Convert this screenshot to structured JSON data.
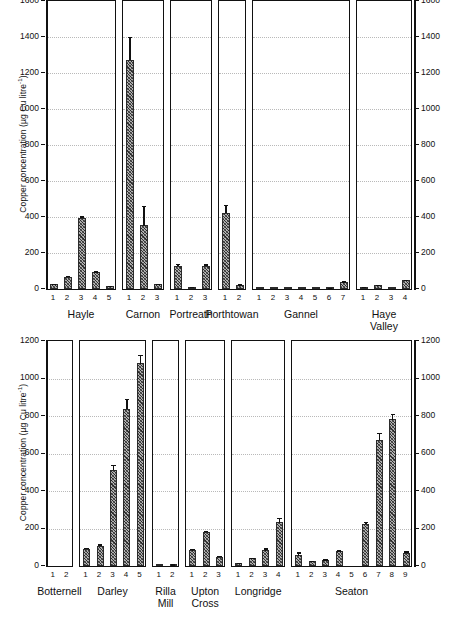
{
  "figure": {
    "axis_label": "Copper concentration (µg Cu litre",
    "axis_label_sup": "-1",
    "axis_label_tail": ")"
  },
  "chart_data": {
    "type": "bar",
    "title": "",
    "xlabel": "",
    "ylabel": "Copper concentration (µg Cu litre⁻¹)",
    "grid": true,
    "legend": "none",
    "error_bars": "standard error",
    "panels": [
      {
        "row": 0,
        "site": "Hayle",
        "ylim": [
          0,
          1600
        ],
        "yticks": [
          0,
          200,
          400,
          600,
          800,
          1000,
          1200,
          1400,
          1600
        ],
        "categories": [
          "1",
          "2",
          "3",
          "4",
          "5"
        ],
        "values": [
          25,
          65,
          395,
          92,
          12
        ],
        "errors": [
          4,
          10,
          8,
          6,
          3
        ]
      },
      {
        "row": 0,
        "site": "Carnon",
        "ylim": [
          0,
          1600
        ],
        "yticks": [
          0,
          200,
          400,
          600,
          800,
          1000,
          1200,
          1400,
          1600
        ],
        "categories": [
          "1",
          "2",
          "3"
        ],
        "values": [
          1270,
          352,
          25
        ],
        "errors": [
          130,
          110,
          5
        ]
      },
      {
        "row": 0,
        "site": "Portreath",
        "ylim": [
          0,
          1600
        ],
        "yticks": [
          0,
          200,
          400,
          600,
          800,
          1000,
          1200,
          1400,
          1600
        ],
        "categories": [
          "1",
          "2",
          "3"
        ],
        "values": [
          128,
          8,
          125
        ],
        "errors": [
          10,
          2,
          12
        ]
      },
      {
        "row": 0,
        "site": "Porthtowan",
        "ylim": [
          0,
          1600
        ],
        "yticks": [
          0,
          200,
          400,
          600,
          800,
          1000,
          1200,
          1400,
          1600
        ],
        "categories": [
          "1",
          "2"
        ],
        "values": [
          420,
          22
        ],
        "errors": [
          45,
          4
        ]
      },
      {
        "row": 0,
        "site": "Gannel",
        "ylim": [
          0,
          1600
        ],
        "yticks": [
          0,
          200,
          400,
          600,
          800,
          1000,
          1200,
          1400,
          1600
        ],
        "categories": [
          "1",
          "2",
          "3",
          "4",
          "5",
          "6",
          "7"
        ],
        "values": [
          2,
          2,
          2,
          2,
          2,
          5,
          38
        ],
        "errors": [
          0,
          0,
          0,
          0,
          0,
          1,
          4
        ]
      },
      {
        "row": 0,
        "site": "Haye\nValley",
        "ylim": [
          0,
          1600
        ],
        "yticks": [
          0,
          200,
          400,
          600,
          800,
          1000,
          1200,
          1400,
          1600
        ],
        "categories": [
          "1",
          "2",
          "3",
          "4"
        ],
        "values": [
          8,
          20,
          2,
          48
        ],
        "errors": [
          2,
          3,
          0,
          4
        ]
      },
      {
        "row": 1,
        "site": "Botternell",
        "ylim": [
          0,
          1200
        ],
        "yticks": [
          0,
          200,
          400,
          600,
          800,
          1000,
          1200
        ],
        "categories": [
          "1",
          "2"
        ],
        "values": [
          0,
          0
        ],
        "errors": [
          0,
          0
        ]
      },
      {
        "row": 1,
        "site": "Darley",
        "ylim": [
          0,
          1200
        ],
        "yticks": [
          0,
          200,
          400,
          600,
          800,
          1000,
          1200
        ],
        "categories": [
          "1",
          "2",
          "3",
          "4",
          "5"
        ],
        "values": [
          90,
          105,
          510,
          835,
          1080
        ],
        "errors": [
          8,
          10,
          30,
          55,
          45
        ]
      },
      {
        "row": 1,
        "site": "Rilla\nMill",
        "ylim": [
          0,
          1200
        ],
        "yticks": [
          0,
          200,
          400,
          600,
          800,
          1000,
          1200
        ],
        "categories": [
          "1",
          "2"
        ],
        "values": [
          3,
          8
        ],
        "errors": [
          0,
          1
        ]
      },
      {
        "row": 1,
        "site": "Upton\nCross",
        "ylim": [
          0,
          1200
        ],
        "yticks": [
          0,
          200,
          400,
          600,
          800,
          1000,
          1200
        ],
        "categories": [
          "1",
          "2",
          "3"
        ],
        "values": [
          82,
          180,
          48
        ],
        "errors": [
          10,
          8,
          5
        ]
      },
      {
        "row": 1,
        "site": "Longridge",
        "ylim": [
          0,
          1200
        ],
        "yticks": [
          0,
          200,
          400,
          600,
          800,
          1000,
          1200
        ],
        "categories": [
          "1",
          "2",
          "3",
          "4"
        ],
        "values": [
          15,
          38,
          82,
          232
        ],
        "errors": [
          3,
          5,
          12,
          25
        ]
      },
      {
        "row": 1,
        "site": "Seaton",
        "ylim": [
          0,
          1200
        ],
        "yticks": [
          0,
          200,
          400,
          600,
          800,
          1000,
          1200
        ],
        "categories": [
          "1",
          "2",
          "3",
          "4",
          "5",
          "6",
          "7",
          "8",
          "9"
        ],
        "values": [
          55,
          25,
          30,
          78,
          0,
          222,
          670,
          780,
          68
        ],
        "errors": [
          18,
          4,
          5,
          5,
          0,
          12,
          38,
          32,
          10
        ]
      }
    ]
  }
}
